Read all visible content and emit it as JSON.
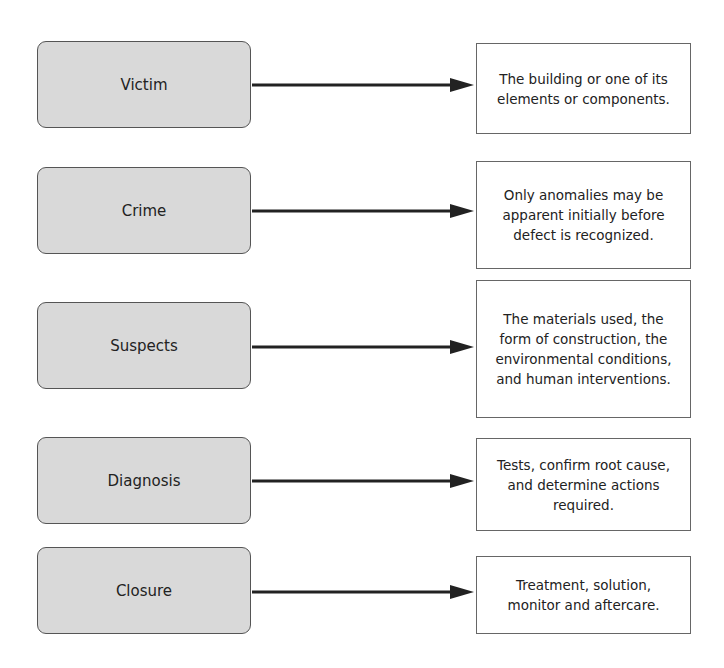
{
  "diagram": {
    "rows": [
      {
        "stage": "Victim",
        "description": "The building or one of its elements or components."
      },
      {
        "stage": "Crime",
        "description": "Only anomalies may be apparent initially before defect is recognized."
      },
      {
        "stage": "Suspects",
        "description": "The materials used, the form of construction, the environmental conditions, and human interventions."
      },
      {
        "stage": "Diagnosis",
        "description": "Tests, confirm root cause, and determine actions required."
      },
      {
        "stage": "Closure",
        "description": "Treatment, solution, monitor and aftercare."
      }
    ]
  },
  "colors": {
    "stage_fill": "#d9d9d9",
    "stage_border": "#555555",
    "desc_fill": "#ffffff",
    "arrow": "#222222"
  }
}
